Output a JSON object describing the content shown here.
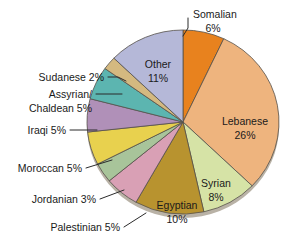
{
  "chart_data": {
    "type": "pie",
    "title": "",
    "subtitle": "",
    "xlabel": "",
    "ylabel": "",
    "legend_position": "none",
    "grid": false,
    "units": "percent",
    "start_angle_deg": 0,
    "direction": "clockwise",
    "categories": [
      "Somalian",
      "Lebanese",
      "Syrian",
      "Egyptian",
      "Palestinian",
      "Jordanian",
      "Moroccan",
      "Iraqi",
      "Assyrian/Chaldean",
      "Sudanese",
      "Other"
    ],
    "values": [
      6,
      26,
      8,
      10,
      5,
      3,
      5,
      5,
      5,
      2,
      11
    ],
    "colors": [
      "#e8821e",
      "#eeb47e",
      "#d6e3a6",
      "#b8932f",
      "#d9a0b5",
      "#a8c49a",
      "#e8d14e",
      "#b090b8",
      "#5cb5b0",
      "#d4b980",
      "#b5b8d8"
    ],
    "slices": [
      {
        "label": "Somalian",
        "value": 6,
        "display": "Somalian\n6%",
        "color": "#e8821e",
        "label_placement": "outside"
      },
      {
        "label": "Lebanese",
        "value": 26,
        "display": "Lebanese\n26%",
        "color": "#eeb47e",
        "label_placement": "inside"
      },
      {
        "label": "Syrian",
        "value": 8,
        "display": "Syrian\n8%",
        "color": "#d6e3a6",
        "label_placement": "inside"
      },
      {
        "label": "Egyptian",
        "value": 10,
        "display": "Egyptian\n10%",
        "color": "#b8932f",
        "label_placement": "inside"
      },
      {
        "label": "Palestinian",
        "value": 5,
        "display": "Palestinian 5%",
        "color": "#d9a0b5",
        "label_placement": "outside"
      },
      {
        "label": "Jordanian",
        "value": 3,
        "display": "Jordanian 3%",
        "color": "#a8c49a",
        "label_placement": "outside"
      },
      {
        "label": "Moroccan",
        "value": 5,
        "display": "Moroccan 5%",
        "color": "#e8d14e",
        "label_placement": "outside"
      },
      {
        "label": "Iraqi",
        "value": 5,
        "display": "Iraqi 5%",
        "color": "#b090b8",
        "label_placement": "outside"
      },
      {
        "label": "Assyrian/Chaldean",
        "value": 5,
        "display": "Assyrian/ Chaldean 5%",
        "color": "#5cb5b0",
        "label_placement": "outside"
      },
      {
        "label": "Sudanese",
        "value": 2,
        "display": "Sudanese 2%",
        "color": "#d4b980",
        "label_placement": "outside"
      },
      {
        "label": "Other",
        "value": 11,
        "display": "Other\n11%",
        "color": "#b5b8d8",
        "label_placement": "inside"
      }
    ]
  },
  "labels": {
    "somalian_name": "Somalian",
    "somalian_pct": "6%",
    "lebanese_name": "Lebanese",
    "lebanese_pct": "26%",
    "syrian_name": "Syrian",
    "syrian_pct": "8%",
    "egyptian_name": "Egyptian",
    "egyptian_pct": "10%",
    "palestinian": "Palestinian 5%",
    "jordanian": "Jordanian 3%",
    "moroccan": "Moroccan 5%",
    "iraqi": "Iraqi 5%",
    "assyrian_line1": "Assyrian/",
    "assyrian_line2": "Chaldean 5%",
    "sudanese": "Sudanese 2%",
    "other_name": "Other",
    "other_pct": "11%"
  }
}
